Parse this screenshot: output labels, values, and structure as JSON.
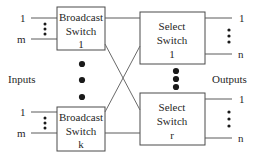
{
  "diagram": {
    "colors": {
      "background": "#ffffff",
      "box_stroke": "#4a4a4a",
      "wire": "#5a5a5a",
      "cross_wire": "#6a6a6a",
      "text": "#1f1f1f",
      "dot": "#1a1a1a"
    },
    "side_labels": {
      "inputs": "Inputs",
      "outputs": "Outputs"
    },
    "stages": {
      "broadcast": [
        {
          "id": "broadcast-switch-1",
          "line1": "Broadcast",
          "line2": "Switch",
          "line3": "1",
          "input_ports": [
            "1",
            "m"
          ],
          "vertical_ellipsis": "⋮"
        },
        {
          "id": "broadcast-switch-k",
          "line1": "Broadcast",
          "line2": "Switch",
          "line3": "k",
          "input_ports": [
            "1",
            "m"
          ],
          "vertical_ellipsis": "⋮"
        }
      ],
      "select": [
        {
          "id": "select-switch-1",
          "line1": "Select",
          "line2": "Switch",
          "line3": "1",
          "output_ports": [
            "1",
            "n"
          ],
          "vertical_ellipsis": "⋮"
        },
        {
          "id": "select-switch-r",
          "line1": "Select",
          "line2": "Switch",
          "line3": "r",
          "output_ports": [
            "1",
            "n"
          ],
          "vertical_ellipsis": "⋮"
        }
      ]
    },
    "ellipses": {
      "broadcast_stage_dots": 3,
      "select_stage_dots": 3,
      "input_port_dots": 3,
      "output_port_dots": 3
    }
  }
}
